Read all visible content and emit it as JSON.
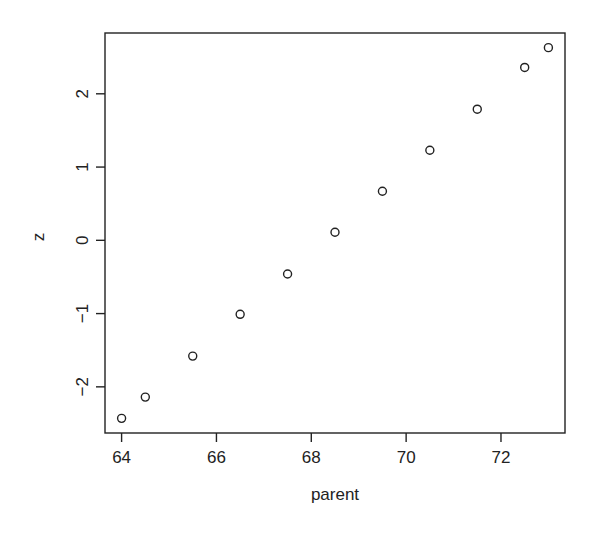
{
  "chart_data": {
    "type": "scatter",
    "title": "",
    "xlabel": "parent",
    "ylabel": "z",
    "xlim": [
      63.65,
      73.35
    ],
    "ylim": [
      -2.63,
      2.83
    ],
    "x_ticks": [
      64,
      66,
      68,
      70,
      72
    ],
    "y_ticks": [
      -2,
      -1,
      0,
      1,
      2
    ],
    "x_tick_labels": [
      "64",
      "66",
      "68",
      "70",
      "72"
    ],
    "y_tick_labels": [
      "−2",
      "−1",
      "0",
      "1",
      "2"
    ],
    "grid": false,
    "legend": null,
    "marker": "open-circle",
    "series": [
      {
        "name": "z",
        "x": [
          64,
          64.5,
          65.5,
          66.5,
          67.5,
          68.5,
          69.5,
          70.5,
          71.5,
          72.5,
          73
        ],
        "y": [
          -2.43,
          -2.14,
          -1.58,
          -1.01,
          -0.46,
          0.11,
          0.67,
          1.23,
          1.79,
          2.36,
          2.63
        ]
      }
    ]
  },
  "colors": {
    "axis": "#222222",
    "marker": "#222222",
    "background": "#ffffff"
  }
}
